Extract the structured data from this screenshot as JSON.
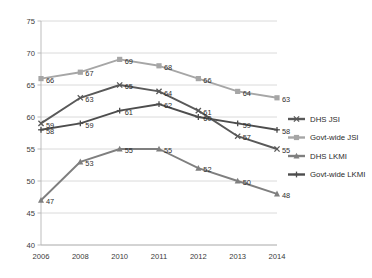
{
  "chart_data": {
    "type": "line",
    "title": "",
    "xlabel": "",
    "ylabel": "",
    "categories": [
      "2006",
      "2008",
      "2010",
      "2011",
      "2012",
      "2013",
      "2014"
    ],
    "ylim": [
      40,
      75
    ],
    "yticks": [
      40,
      45,
      50,
      55,
      60,
      65,
      70,
      75
    ],
    "grid": true,
    "legend_position": "right",
    "series": [
      {
        "name": "DHS JSI",
        "values": [
          59,
          63,
          65,
          64,
          61,
          57,
          55
        ],
        "color": "#595959",
        "marker": "x"
      },
      {
        "name": "Govt-wide JSI",
        "values": [
          66,
          67,
          69,
          68,
          66,
          64,
          63
        ],
        "color": "#a6a6a6",
        "marker": "square"
      },
      {
        "name": "DHS LKMI",
        "values": [
          47,
          53,
          55,
          55,
          52,
          50,
          48
        ],
        "color": "#7f7f7f",
        "marker": "triangle"
      },
      {
        "name": "Govt-wide LKMI",
        "values": [
          58,
          59,
          61,
          62,
          60,
          59,
          58
        ],
        "color": "#4d4d4d",
        "marker": "plus"
      }
    ]
  },
  "axis": {
    "y_tick_labels": [
      "75",
      "70",
      "65",
      "60",
      "55",
      "50",
      "45",
      "40"
    ],
    "x_tick_labels": [
      "2006",
      "2008",
      "2010",
      "2011",
      "2012",
      "2013",
      "2014"
    ]
  },
  "legend": {
    "items": [
      {
        "label": "DHS JSI",
        "color": "#595959",
        "marker": "x"
      },
      {
        "label": "Govt-wide JSI",
        "color": "#a6a6a6",
        "marker": "square"
      },
      {
        "label": "DHS LKMI",
        "color": "#7f7f7f",
        "marker": "triangle"
      },
      {
        "label": "Govt-wide LKMI",
        "color": "#4d4d4d",
        "marker": "plus"
      }
    ]
  }
}
